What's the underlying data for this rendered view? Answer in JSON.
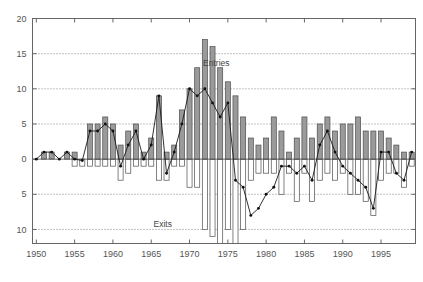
{
  "chart_data": {
    "type": "bar",
    "title": "",
    "subtitle": "",
    "xlabel": "",
    "ylabel": "",
    "xlim": [
      1949.5,
      1999.5
    ],
    "ylim": [
      -12,
      20
    ],
    "grid": true,
    "legend_position": "inline-annotations",
    "y_ticks": [
      20,
      15,
      10,
      5,
      0,
      5,
      10
    ],
    "y_tick_values": [
      20,
      15,
      10,
      5,
      0,
      -5,
      -10
    ],
    "x_ticks": [
      1950,
      1955,
      1960,
      1965,
      1970,
      1975,
      1980,
      1985,
      1990,
      1995
    ],
    "annotations": [
      {
        "text": "Entries",
        "x": 1973.5,
        "y": 13.2
      },
      {
        "text": "Exits",
        "x": 1966.5,
        "y": -9.6
      }
    ],
    "categories": [
      1950,
      1951,
      1952,
      1953,
      1954,
      1955,
      1956,
      1957,
      1958,
      1959,
      1960,
      1961,
      1962,
      1963,
      1964,
      1965,
      1966,
      1967,
      1968,
      1969,
      1970,
      1971,
      1972,
      1973,
      1974,
      1975,
      1976,
      1977,
      1978,
      1979,
      1980,
      1981,
      1982,
      1983,
      1984,
      1985,
      1986,
      1987,
      1988,
      1989,
      1990,
      1991,
      1992,
      1993,
      1994,
      1995,
      1996,
      1997,
      1998,
      1999
    ],
    "series": [
      {
        "name": "Entries",
        "type": "bar",
        "color": "#9a9a9a",
        "values": [
          0,
          1,
          1,
          0,
          1,
          1,
          0,
          5,
          5,
          6,
          5,
          2,
          4,
          5,
          1,
          3,
          9,
          1,
          2,
          7,
          10,
          13,
          17,
          16,
          13,
          11,
          9,
          6,
          3,
          2,
          3,
          6,
          4,
          1,
          3,
          6,
          3,
          5,
          6,
          4,
          5,
          5,
          6,
          4,
          4,
          4,
          3,
          2,
          1,
          1
        ]
      },
      {
        "name": "Exits",
        "type": "bar",
        "color": "#ffffff",
        "values": [
          0,
          0,
          0,
          0,
          0,
          -1,
          -1,
          -1,
          -1,
          -1,
          -1,
          -3,
          -2,
          -1,
          -1,
          -1,
          -3,
          -3,
          -1,
          -1,
          -4,
          -4,
          -10,
          -11,
          -12,
          -10,
          -12,
          -10,
          -3,
          -2,
          -2,
          -2,
          -5,
          -2,
          -6,
          -2,
          -6,
          -3,
          -2,
          -3,
          -2,
          -5,
          -5,
          -6,
          -8,
          -3,
          -2,
          -2,
          -4,
          -1
        ]
      },
      {
        "name": "Net",
        "type": "line",
        "color": "#111111",
        "values": [
          0,
          1,
          1,
          0,
          1,
          0,
          -0.2,
          4,
          4,
          5,
          4,
          -1,
          2,
          4,
          0,
          2,
          9,
          -2,
          1,
          5,
          10,
          9,
          10,
          8,
          6,
          8,
          -3,
          -4,
          -8,
          -7,
          -5,
          -4,
          -1,
          -1,
          -2,
          -1,
          -3,
          2,
          4,
          1,
          -1,
          -2,
          -3,
          -4,
          -7,
          1,
          1,
          -2,
          -3,
          1
        ]
      }
    ]
  }
}
